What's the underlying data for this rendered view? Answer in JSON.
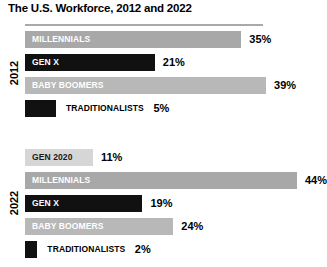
{
  "chart_data": {
    "type": "bar",
    "title": "The U.S. Workforce, 2012 and 2022",
    "xlabel": "",
    "ylabel": "",
    "orientation": "horizontal",
    "grid": false,
    "legend": "none",
    "value_suffix": "%",
    "xlim": [
      0,
      50
    ],
    "groups": [
      {
        "year": "2012",
        "bars": [
          {
            "label": "MILLENNIALS",
            "value": 35,
            "value_text": "35%",
            "color": "#a8a8a8",
            "label_position": "inside",
            "label_color": "light"
          },
          {
            "label": "GEN X",
            "value": 21,
            "value_text": "21%",
            "color": "#111111",
            "label_position": "inside",
            "label_color": "light"
          },
          {
            "label": "BABY BOOMERS",
            "value": 39,
            "value_text": "39%",
            "color": "#b8b8b8",
            "label_position": "inside",
            "label_color": "light"
          },
          {
            "label": "TRADITIONALISTS",
            "value": 5,
            "value_text": "5%",
            "color": "#111111",
            "label_position": "outside",
            "label_color": "dark"
          }
        ]
      },
      {
        "year": "2022",
        "bars": [
          {
            "label": "GEN 2020",
            "value": 11,
            "value_text": "11%",
            "color": "#d6d6d6",
            "label_position": "inside",
            "label_color": "dark"
          },
          {
            "label": "MILLENNIALS",
            "value": 44,
            "value_text": "44%",
            "color": "#a8a8a8",
            "label_position": "inside",
            "label_color": "light"
          },
          {
            "label": "GEN X",
            "value": 19,
            "value_text": "19%",
            "color": "#111111",
            "label_position": "inside",
            "label_color": "light"
          },
          {
            "label": "BABY BOOMERS",
            "value": 24,
            "value_text": "24%",
            "color": "#b8b8b8",
            "label_position": "inside",
            "label_color": "light"
          },
          {
            "label": "TRADITIONALISTS",
            "value": 2,
            "value_text": "2%",
            "color": "#111111",
            "label_position": "outside",
            "label_color": "dark"
          }
        ]
      }
    ]
  }
}
